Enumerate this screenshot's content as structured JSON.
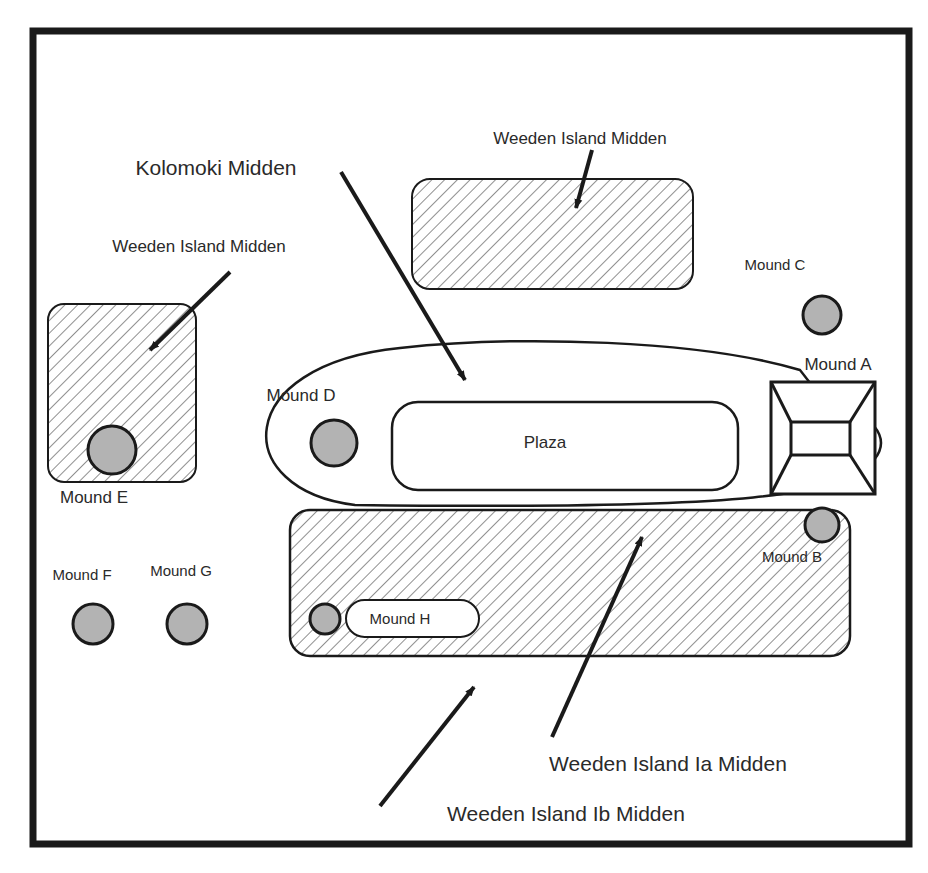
{
  "figure": {
    "type": "site-plan",
    "colors": {
      "ink": "#1a1a1a",
      "mound_fill": "#b3b3b3",
      "hatch": "#333333",
      "background": "#ffffff"
    }
  },
  "labels": {
    "kolomoki_midden": "Kolomoki Midden",
    "weeden_midden_top": "Weeden Island Midden",
    "weeden_midden_left": "Weeden Island Midden",
    "weeden_ia_midden": "Weeden Island Ia Midden",
    "weeden_ib_midden": "Weeden Island Ib Midden",
    "plaza": "Plaza"
  },
  "mounds": {
    "a": "Mound A",
    "b": "Mound B",
    "c": "Mound C",
    "d": "Mound D",
    "e": "Mound E",
    "f": "Mound F",
    "g": "Mound G",
    "h": "Mound H"
  }
}
